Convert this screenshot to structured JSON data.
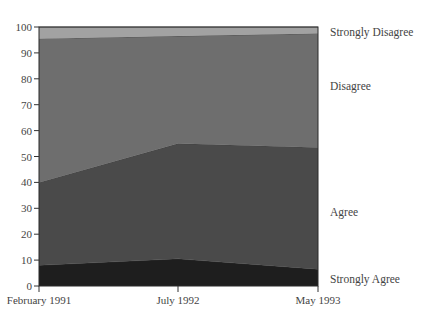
{
  "chart_data": {
    "type": "area",
    "stacked": true,
    "title": "",
    "xlabel": "",
    "ylabel": "",
    "categories": [
      "February 1991",
      "July 1992",
      "May 1993"
    ],
    "series": [
      {
        "name": "Strongly Agree",
        "values": [
          8,
          10.5,
          6.5
        ],
        "color": "#1e1e1e"
      },
      {
        "name": "Agree",
        "values": [
          32,
          44.5,
          47
        ],
        "color": "#4a4a4a"
      },
      {
        "name": "Disagree",
        "values": [
          55.5,
          41.5,
          44
        ],
        "color": "#6e6e6e"
      },
      {
        "name": "Strongly Disagree",
        "values": [
          4.5,
          3.5,
          2.5
        ],
        "color": "#a2a2a2"
      }
    ],
    "ylim": [
      0,
      100
    ],
    "yticks": [
      0,
      10,
      20,
      30,
      40,
      50,
      60,
      70,
      80,
      90,
      100
    ],
    "grid": false,
    "legend_position": "right (inline labels)"
  },
  "axis": {
    "y_tick_labels": [
      "0",
      "10",
      "20",
      "30",
      "40",
      "50",
      "60",
      "70",
      "80",
      "90",
      "100"
    ],
    "x_tick_labels": [
      "February 1991",
      "July 1992",
      "May 1993"
    ]
  },
  "legend": {
    "strongly_disagree": "Strongly Disagree",
    "disagree": "Disagree",
    "agree": "Agree",
    "strongly_agree": "Strongly Agree"
  }
}
